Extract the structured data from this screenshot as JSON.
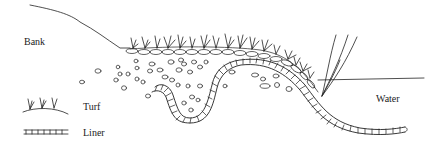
{
  "diagram": {
    "labels": {
      "bank": "Bank",
      "water": "Water"
    },
    "legend": [
      {
        "symbol": "turf-symbol",
        "label": "Turf"
      },
      {
        "symbol": "liner-symbol",
        "label": "Liner"
      }
    ],
    "colors": {
      "ink": "#222222",
      "background": "#ffffff"
    }
  }
}
